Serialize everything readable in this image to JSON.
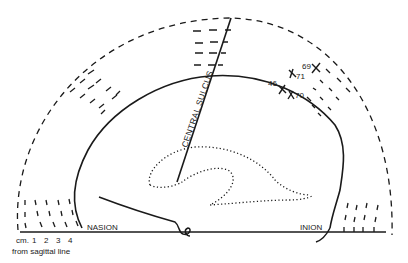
{
  "diagram": {
    "type": "brain lateral view with electrode positions",
    "labels": {
      "central_sulcus": "CENTRAL SULCUS",
      "nasion": "NASION",
      "inion": "INION",
      "scale_unit": "cm.",
      "scale_ticks": [
        "1",
        "2",
        "3",
        "4"
      ],
      "scale_caption": "from sagittal line"
    },
    "points": [
      {
        "id": "69",
        "label": "69"
      },
      {
        "id": "71",
        "label": "71"
      },
      {
        "id": "46",
        "label": "46"
      },
      {
        "id": "70",
        "label": "70"
      }
    ],
    "colors": {
      "ink": "#1a1a1a",
      "background": "#ffffff"
    }
  }
}
